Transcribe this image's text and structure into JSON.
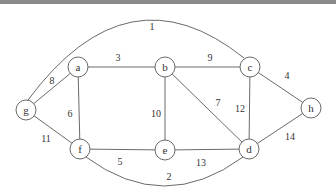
{
  "graph": {
    "nodes": [
      {
        "id": "a",
        "x": 78,
        "y": 67
      },
      {
        "id": "b",
        "x": 165,
        "y": 67
      },
      {
        "id": "c",
        "x": 250,
        "y": 67
      },
      {
        "id": "g",
        "x": 26,
        "y": 110
      },
      {
        "id": "f",
        "x": 80,
        "y": 149
      },
      {
        "id": "e",
        "x": 165,
        "y": 150
      },
      {
        "id": "d",
        "x": 249,
        "y": 149
      },
      {
        "id": "h",
        "x": 311,
        "y": 108
      }
    ],
    "edges": [
      {
        "from": "g",
        "to": "c",
        "weight": "1",
        "curve": "arc-top",
        "lx": 152,
        "ly": 26
      },
      {
        "from": "f",
        "to": "d",
        "weight": "2",
        "curve": "arc-bottom",
        "lx": 169,
        "ly": 176
      },
      {
        "from": "a",
        "to": "b",
        "weight": "3",
        "lx": 118,
        "ly": 57
      },
      {
        "from": "c",
        "to": "h",
        "weight": "4",
        "lx": 287,
        "ly": 75
      },
      {
        "from": "f",
        "to": "e",
        "weight": "5",
        "lx": 120,
        "ly": 161
      },
      {
        "from": "a",
        "to": "f",
        "weight": "6",
        "lx": 70,
        "ly": 113
      },
      {
        "from": "b",
        "to": "d",
        "weight": "7",
        "lx": 218,
        "ly": 102
      },
      {
        "from": "g",
        "to": "a",
        "weight": "8",
        "lx": 52,
        "ly": 80
      },
      {
        "from": "b",
        "to": "c",
        "weight": "9",
        "lx": 210,
        "ly": 57
      },
      {
        "from": "b",
        "to": "e",
        "weight": "10",
        "lx": 156,
        "ly": 113
      },
      {
        "from": "g",
        "to": "f",
        "weight": "11",
        "lx": 46,
        "ly": 138
      },
      {
        "from": "c",
        "to": "d",
        "weight": "12",
        "lx": 240,
        "ly": 108
      },
      {
        "from": "e",
        "to": "d",
        "weight": "13",
        "lx": 201,
        "ly": 162
      },
      {
        "from": "d",
        "to": "h",
        "weight": "14",
        "lx": 290,
        "ly": 136
      }
    ]
  }
}
